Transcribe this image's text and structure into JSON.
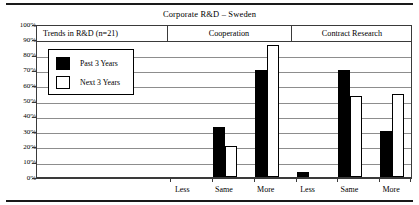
{
  "chart_data": {
    "type": "bar",
    "title": "Corporate R&D – Sweden",
    "xlabel": "",
    "ylabel": "",
    "ylim": [
      0,
      100
    ],
    "grid": true,
    "legend_position": "inside-upper-left",
    "ytick_labels": [
      "100%",
      "90%",
      "80%",
      "70%",
      "60%",
      "50%",
      "40%",
      "30%",
      "20%",
      "10%",
      "0%"
    ],
    "ytick_values": [
      100,
      90,
      80,
      70,
      60,
      50,
      40,
      30,
      20,
      10,
      0
    ],
    "panels": [
      {
        "label": "Trends in R&D (n=21)",
        "categories": []
      },
      {
        "label": "Cooperation",
        "categories": [
          "Less",
          "Same",
          "More"
        ]
      },
      {
        "label": "Contract Research",
        "categories": [
          "Less",
          "Same",
          "More"
        ]
      }
    ],
    "categories": [
      "Less",
      "Same",
      "More",
      "Less",
      "Same",
      "More"
    ],
    "series": [
      {
        "name": "Past 3 Years",
        "color": "#000000",
        "values": [
          0,
          33,
          70,
          3,
          70,
          30
        ]
      },
      {
        "name": "Next 3 Years",
        "color": "#ffffff",
        "values": [
          0,
          20,
          86,
          0,
          53,
          54
        ]
      }
    ],
    "legend": [
      {
        "label": "Past 3 Years",
        "swatch": "filled"
      },
      {
        "label": "Next 3 Years",
        "swatch": "hollow"
      }
    ]
  }
}
